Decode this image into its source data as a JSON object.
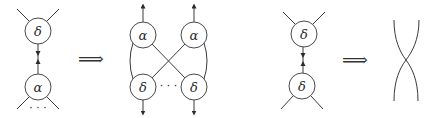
{
  "diagrams": [
    {
      "id": "rule1-lhs",
      "nodes": [
        {
          "label": "δ",
          "role": "top"
        },
        {
          "label": "α",
          "role": "bottom"
        }
      ],
      "ellipsis": "· · ·"
    },
    {
      "id": "rule1-rhs",
      "nodes": [
        {
          "label": "α",
          "role": "top-left"
        },
        {
          "label": "α",
          "role": "top-right"
        },
        {
          "label": "δ",
          "role": "bottom-left"
        },
        {
          "label": "δ",
          "role": "bottom-right"
        }
      ],
      "ellipsis": "· · ·"
    },
    {
      "id": "rule2-lhs",
      "nodes": [
        {
          "label": "δ",
          "role": "top"
        },
        {
          "label": "δ",
          "role": "bottom"
        }
      ]
    },
    {
      "id": "rule2-rhs",
      "description": "two crossing wires"
    }
  ],
  "implies_symbol": "⟹"
}
